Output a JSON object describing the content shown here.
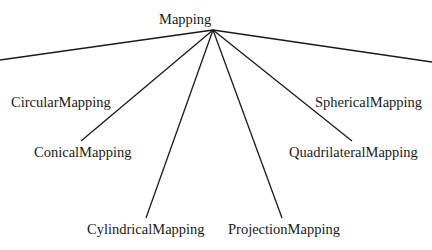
{
  "diagram": {
    "type": "tree",
    "root": {
      "label": "Mapping",
      "x": 213,
      "y": 21
    },
    "hub": {
      "x": 213,
      "y": 30
    },
    "children": [
      {
        "label": "CircularMapping",
        "x": 76,
        "y": 104,
        "line_end": [
          0,
          59
        ]
      },
      {
        "label": "SphericalMapping",
        "x": 367,
        "y": 104,
        "line_end": [
          432,
          62
        ]
      },
      {
        "label": "ConicalMapping",
        "x": 81,
        "y": 153,
        "line_end": [
          81,
          141
        ]
      },
      {
        "label": "QuadrilateralMapping",
        "x": 361,
        "y": 153,
        "line_end": [
          352,
          141
        ]
      },
      {
        "label": "CylindricalMapping",
        "x": 146,
        "y": 230,
        "line_end": [
          146,
          218
        ]
      },
      {
        "label": "ProjectionMapping",
        "x": 283,
        "y": 230,
        "line_end": [
          282,
          218
        ]
      }
    ],
    "colors": {
      "line": "#1a1a1a",
      "text": "#1a1a1a",
      "background": "#ffffff"
    }
  }
}
